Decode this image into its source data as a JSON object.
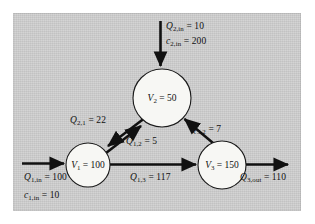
{
  "figure": {
    "background_color": "#cfcfcf",
    "node_fill": "#f7f7f4",
    "ink_color": "#111111"
  },
  "nodes": [
    {
      "id": "V1",
      "var": "V",
      "sub": "1",
      "eq": "= 100",
      "value": 100,
      "cx": 88,
      "cy": 165,
      "r": 22
    },
    {
      "id": "V2",
      "var": "V",
      "sub": "2",
      "eq": "= 50",
      "value": 50,
      "cx": 162,
      "cy": 98,
      "r": 29
    },
    {
      "id": "V3",
      "var": "V",
      "sub": "3",
      "eq": "= 150",
      "value": 150,
      "cx": 222,
      "cy": 165,
      "r": 24
    }
  ],
  "flows": [
    {
      "id": "Q2in",
      "var": "Q",
      "sub": "2,in",
      "eq": "= 10",
      "value": 10,
      "from": "external",
      "to": "V2"
    },
    {
      "id": "c2in",
      "var": "c",
      "sub": "2,in",
      "eq": "= 200",
      "value": 200,
      "from": "external",
      "to": "V2"
    },
    {
      "id": "Q21",
      "var": "Q",
      "sub": "2,1",
      "eq": "= 22",
      "value": 22,
      "from": "V2",
      "to": "V1"
    },
    {
      "id": "Q12",
      "var": "Q",
      "sub": "1,2",
      "eq": "= 5",
      "value": 5,
      "from": "V1",
      "to": "V2"
    },
    {
      "id": "Q32",
      "var": "Q",
      "sub": "3,2",
      "eq": "= 7",
      "value": 7,
      "from": "V3",
      "to": "V2"
    },
    {
      "id": "Q1in",
      "var": "Q",
      "sub": "1,in",
      "eq": "= 100",
      "value": 100,
      "from": "external",
      "to": "V1"
    },
    {
      "id": "c1in",
      "var": "c",
      "sub": "1,in",
      "eq": "= 10",
      "value": 10,
      "from": "external",
      "to": "V1"
    },
    {
      "id": "Q13",
      "var": "Q",
      "sub": "1,3",
      "eq": "= 117",
      "value": 117,
      "from": "V1",
      "to": "V3"
    },
    {
      "id": "Q3out",
      "var": "Q",
      "sub": "3,out",
      "eq": "= 110",
      "value": 110,
      "from": "V3",
      "to": "external"
    }
  ]
}
